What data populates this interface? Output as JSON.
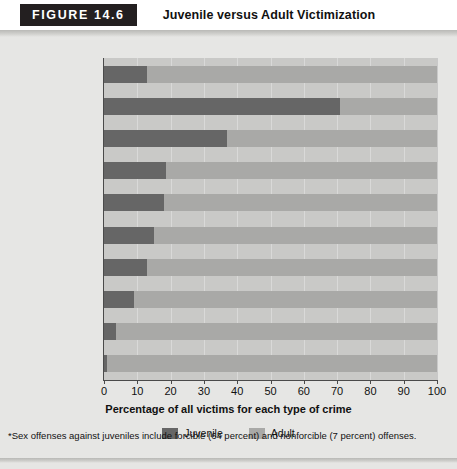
{
  "header": {
    "figure_label": "FIGURE 14.6",
    "title": "Juvenile versus Adult Victimization"
  },
  "footnote": "*Sex offenses against juveniles include forcible (64 percent) and nonforcible (7 percent) offenses.",
  "legend": {
    "items": [
      {
        "label": "Juvenile",
        "color": "#666666"
      },
      {
        "label": "Adult",
        "color": "#a9a9a7"
      }
    ]
  },
  "colors": {
    "juvenile": "#666666",
    "adult": "#a9a9a7",
    "plot_background": "#c9c9c7",
    "page_background": "#e6e6e4",
    "figure_box": "#231f20"
  },
  "chart_data": {
    "type": "bar",
    "orientation": "horizontal",
    "stacked": true,
    "title": "Juvenile versus Adult Victimization",
    "xlabel": "Percentage of all victims for each type of crime",
    "ylabel": "",
    "xlim": [
      0,
      100
    ],
    "xticks": [
      0,
      10,
      20,
      30,
      40,
      50,
      60,
      70,
      80,
      90,
      100
    ],
    "xticklabels": [
      "0",
      "10",
      "20",
      "30",
      "40",
      "50",
      "60",
      "70",
      "80",
      "90",
      "100"
    ],
    "grid": true,
    "legend_position": "bottom",
    "categories": [
      "All crimes",
      "Sex offenses*",
      "Kidnapping",
      "Aggravated assault",
      "Simple assault",
      "Robbery",
      "Homicide",
      "Larceny",
      "Vandalism",
      "Motor vehicle theft"
    ],
    "series": [
      {
        "name": "Juvenile",
        "color": "#666666",
        "values": [
          13,
          71,
          37,
          18.5,
          18,
          15,
          13,
          9,
          3.5,
          1
        ]
      },
      {
        "name": "Adult",
        "color": "#a9a9a7",
        "values": [
          87,
          29,
          63,
          81.5,
          82,
          85,
          87,
          91,
          96.5,
          99
        ]
      }
    ],
    "annotations": [
      "*Sex offenses against juveniles include forcible (64 percent) and nonforcible (7 percent) offenses."
    ]
  }
}
